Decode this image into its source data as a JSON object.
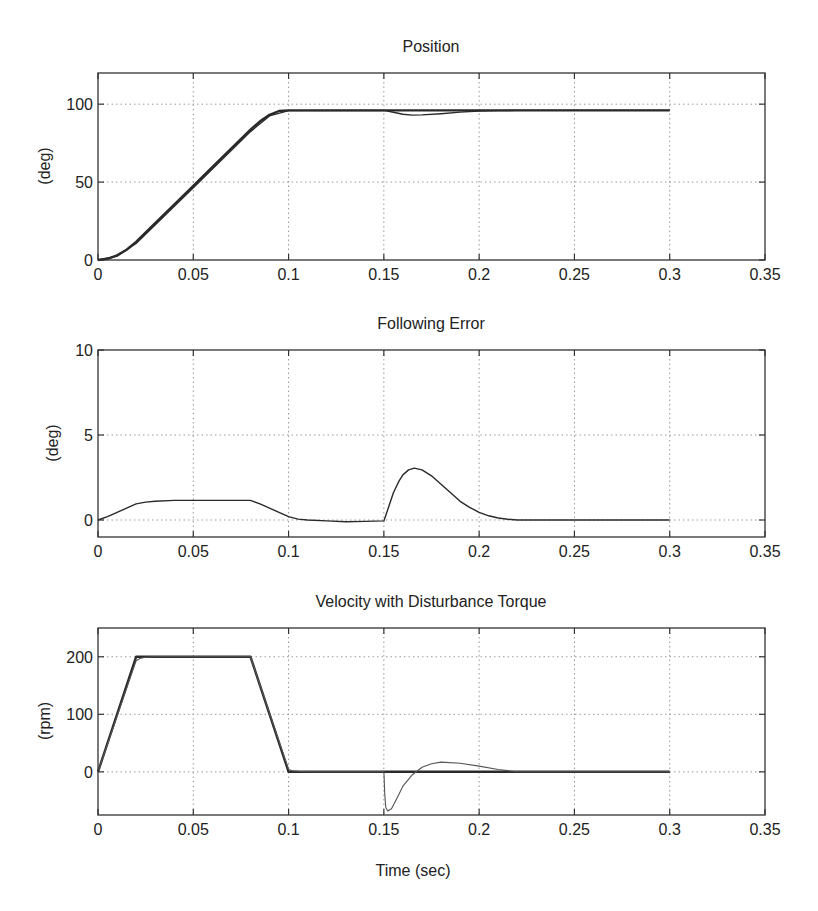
{
  "figure": {
    "xlabel": "Time (sec)"
  },
  "chart_data": [
    {
      "type": "line",
      "title": "Position",
      "xlabel": "",
      "ylabel": "(deg)",
      "xlim": [
        0,
        0.35
      ],
      "ylim": [
        0,
        120
      ],
      "xticks": [
        "0",
        "0.05",
        "0.1",
        "0.15",
        "0.2",
        "0.25",
        "0.3",
        "0.35"
      ],
      "yticks": [
        "0",
        "50",
        "100"
      ],
      "grid": true,
      "series": [
        {
          "name": "Commanded position",
          "x": [
            0,
            0.005,
            0.01,
            0.015,
            0.02,
            0.03,
            0.04,
            0.05,
            0.06,
            0.07,
            0.08,
            0.085,
            0.09,
            0.095,
            0.1,
            0.15,
            0.2,
            0.25,
            0.3
          ],
          "y": [
            0,
            0.8,
            3,
            6.6,
            11.6,
            23.6,
            35.6,
            47.6,
            59.6,
            71.6,
            83.6,
            89,
            93.2,
            95.6,
            96,
            96,
            96,
            96,
            96
          ]
        },
        {
          "name": "Actual position",
          "x": [
            0,
            0.01,
            0.02,
            0.05,
            0.08,
            0.09,
            0.1,
            0.15,
            0.155,
            0.16,
            0.165,
            0.17,
            0.18,
            0.19,
            0.2,
            0.21,
            0.22,
            0.25,
            0.3
          ],
          "y": [
            0,
            2.5,
            10.6,
            46.4,
            82.4,
            92.5,
            95.9,
            96,
            94.8,
            93.5,
            93.0,
            93.1,
            93.9,
            94.9,
            95.6,
            95.9,
            96,
            96,
            96
          ]
        }
      ]
    },
    {
      "type": "line",
      "title": "Following Error",
      "xlabel": "",
      "ylabel": "(deg)",
      "xlim": [
        0,
        0.35
      ],
      "ylim": [
        -1,
        10
      ],
      "xticks": [
        "0",
        "0.05",
        "0.1",
        "0.15",
        "0.2",
        "0.25",
        "0.3",
        "0.35"
      ],
      "yticks": [
        "0",
        "5",
        "10"
      ],
      "grid": true,
      "series": [
        {
          "name": "Following error",
          "x": [
            0,
            0.005,
            0.01,
            0.015,
            0.02,
            0.025,
            0.03,
            0.04,
            0.05,
            0.06,
            0.07,
            0.08,
            0.085,
            0.09,
            0.095,
            0.1,
            0.105,
            0.11,
            0.12,
            0.13,
            0.14,
            0.15,
            0.152,
            0.155,
            0.158,
            0.16,
            0.163,
            0.166,
            0.17,
            0.175,
            0.18,
            0.185,
            0.19,
            0.195,
            0.2,
            0.205,
            0.21,
            0.215,
            0.22,
            0.25,
            0.3
          ],
          "y": [
            0,
            0.2,
            0.45,
            0.7,
            0.95,
            1.05,
            1.1,
            1.15,
            1.15,
            1.15,
            1.15,
            1.15,
            0.95,
            0.7,
            0.45,
            0.2,
            0.05,
            0.0,
            -0.05,
            -0.1,
            -0.08,
            -0.05,
            0.6,
            1.6,
            2.3,
            2.65,
            2.95,
            3.05,
            2.95,
            2.6,
            2.1,
            1.6,
            1.1,
            0.75,
            0.45,
            0.25,
            0.12,
            0.04,
            0.0,
            0.0,
            0.0
          ]
        }
      ]
    },
    {
      "type": "line",
      "title": "Velocity with Disturbance Torque",
      "xlabel": "Time (sec)",
      "ylabel": "(rpm)",
      "xlim": [
        0,
        0.35
      ],
      "ylim": [
        -75,
        250
      ],
      "xticks": [
        "0",
        "0.05",
        "0.1",
        "0.15",
        "0.2",
        "0.25",
        "0.3",
        "0.35"
      ],
      "yticks": [
        "0",
        "100",
        "200"
      ],
      "grid": true,
      "series": [
        {
          "name": "Commanded velocity",
          "x": [
            0,
            0.02,
            0.08,
            0.1,
            0.15,
            0.2,
            0.25,
            0.3
          ],
          "y": [
            0,
            200,
            200,
            0,
            0,
            0,
            0,
            0
          ]
        },
        {
          "name": "Actual velocity",
          "x": [
            0,
            0.02,
            0.022,
            0.025,
            0.03,
            0.08,
            0.1,
            0.102,
            0.105,
            0.11,
            0.15,
            0.1505,
            0.151,
            0.152,
            0.154,
            0.157,
            0.16,
            0.165,
            0.17,
            0.175,
            0.18,
            0.19,
            0.2,
            0.21,
            0.22,
            0.25,
            0.3
          ],
          "y": [
            0,
            193,
            197,
            199,
            200,
            200,
            4,
            2,
            1,
            0,
            0,
            -40,
            -62,
            -68,
            -64,
            -45,
            -25,
            -5,
            8,
            14,
            17,
            15,
            10,
            4,
            0,
            0,
            0
          ]
        }
      ]
    }
  ]
}
